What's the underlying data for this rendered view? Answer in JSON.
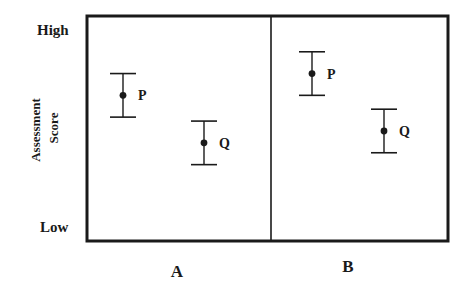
{
  "chart_data": {
    "type": "scatter",
    "title": "",
    "xlabel": "",
    "ylabel_lines": [
      "Assessment",
      "Score"
    ],
    "y_tick_labels": {
      "high": "High",
      "low": "Low"
    },
    "ylim": [
      0,
      10
    ],
    "grid": false,
    "legend": "none",
    "panels": [
      {
        "label": "A",
        "points": [
          {
            "name": "P",
            "mean": 6.7,
            "error": 1.1,
            "slot": 0
          },
          {
            "name": "Q",
            "mean": 4.3,
            "error": 1.1,
            "slot": 1
          }
        ]
      },
      {
        "label": "B",
        "points": [
          {
            "name": "P",
            "mean": 7.8,
            "error": 1.1,
            "slot": 0
          },
          {
            "name": "Q",
            "mean": 4.9,
            "error": 1.1,
            "slot": 1
          }
        ]
      }
    ],
    "colors": {
      "ink": "#1a1a1a",
      "background": "#ffffff"
    }
  }
}
